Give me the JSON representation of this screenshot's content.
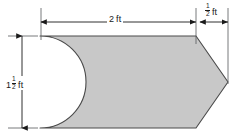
{
  "figure": {
    "units": "ft",
    "fill_color": "#c8c8c8",
    "outline_color": "#4a4a4a",
    "dimension_color": "#1a1a1a",
    "background_color": "#ffffff"
  },
  "dimensions": {
    "width": {
      "name": "overall-body-length",
      "value_whole": "2",
      "unit": "ft",
      "label": "2 ft",
      "orientation": "horizontal"
    },
    "flange": {
      "name": "point-length",
      "fraction_numerator": "1",
      "fraction_denominator": "2",
      "unit": "ft",
      "label": "1/2 ft",
      "orientation": "horizontal"
    },
    "height": {
      "name": "overall-height",
      "value_whole": "1",
      "fraction_numerator": "1",
      "fraction_denominator": "2",
      "unit": "ft",
      "label": "1 1/2 ft",
      "orientation": "vertical"
    }
  },
  "shape": {
    "name": "notched-pointed-plate",
    "body_left_x": 40,
    "body_right_x": 196,
    "tip_x": 228,
    "top_y": 36,
    "bottom_y": 128,
    "mid_y": 82,
    "notch_type": "semicircular-cutout",
    "notch_apex_x": 86
  }
}
